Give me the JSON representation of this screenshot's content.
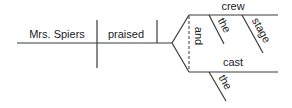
{
  "diagram": {
    "type": "sentence-diagram",
    "subject": "Mrs. Spiers",
    "verb": "praised",
    "conjunction": "and",
    "objects": [
      {
        "word": "crew",
        "modifiers": [
          "the",
          "stage"
        ]
      },
      {
        "word": "cast",
        "modifiers": [
          "the"
        ]
      }
    ]
  }
}
